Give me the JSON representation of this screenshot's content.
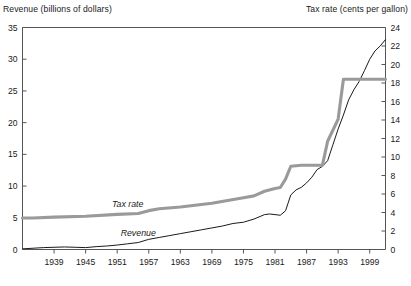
{
  "chart_data": {
    "type": "line",
    "title": "",
    "xlabel": "",
    "ylabel": "Revenue (billions of dollars)",
    "y2label": "Tax rate (cents per gallon)",
    "grid": false,
    "legend_position": "inline-annotations",
    "xlim": [
      1933,
      2002
    ],
    "ylim": [
      0,
      35
    ],
    "y2lim": [
      0,
      24
    ],
    "xticks": [
      1939,
      1945,
      1951,
      1957,
      1963,
      1969,
      1975,
      1981,
      1987,
      1993,
      1999
    ],
    "xtick_labels": [
      "1939",
      "1945",
      "1951",
      "1957",
      "1963",
      "1969",
      "1975",
      "1981",
      "1987",
      "1993",
      "1999"
    ],
    "yticks": [
      0,
      5,
      10,
      15,
      20,
      25,
      30,
      35
    ],
    "ytick_labels": [
      "0",
      "5",
      "10",
      "15",
      "20",
      "25",
      "30",
      "35"
    ],
    "y2ticks": [
      0,
      2,
      4,
      6,
      8,
      10,
      12,
      14,
      16,
      18,
      20,
      22,
      24
    ],
    "y2tick_labels": [
      "0",
      "2",
      "4",
      "6",
      "8",
      "10",
      "12",
      "14",
      "16",
      "18",
      "20",
      "22",
      "24"
    ],
    "series": [
      {
        "name": "Revenue",
        "axis": "left",
        "units": "billions of dollars",
        "color": "#1a1a1a",
        "style": "thin-black-line",
        "label_text": "Revenue",
        "x": [
          1933,
          1935,
          1937,
          1939,
          1941,
          1943,
          1945,
          1947,
          1949,
          1951,
          1953,
          1955,
          1957,
          1959,
          1961,
          1963,
          1965,
          1967,
          1969,
          1971,
          1973,
          1975,
          1977,
          1979,
          1980,
          1981,
          1982,
          1983,
          1984,
          1985,
          1986,
          1987,
          1988,
          1989,
          1990,
          1991,
          1992,
          1993,
          1994,
          1995,
          1996,
          1997,
          1998,
          1999,
          2000,
          2001,
          2002
        ],
        "values": [
          0.1,
          0.2,
          0.3,
          0.35,
          0.4,
          0.35,
          0.3,
          0.45,
          0.55,
          0.7,
          0.9,
          1.1,
          1.6,
          1.9,
          2.2,
          2.5,
          2.8,
          3.1,
          3.4,
          3.7,
          4.1,
          4.3,
          4.8,
          5.5,
          5.6,
          5.5,
          5.4,
          6.1,
          8.6,
          9.4,
          9.8,
          10.5,
          11.4,
          12.6,
          13.1,
          14.0,
          16.5,
          19.0,
          21.2,
          23.6,
          25.2,
          26.5,
          28.2,
          30.0,
          31.3,
          32.1,
          33.1
        ]
      },
      {
        "name": "Tax rate",
        "axis": "right",
        "units": "cents per gallon",
        "color": "#9a9a9a",
        "style": "thick-gray-line",
        "label_text": "Tax rate",
        "x": [
          1933,
          1935,
          1939,
          1945,
          1951,
          1955,
          1957,
          1959,
          1963,
          1969,
          1975,
          1977,
          1979,
          1981,
          1982,
          1983,
          1984,
          1986,
          1988,
          1990,
          1991,
          1993,
          1994,
          1996,
          1999,
          2002
        ],
        "values": [
          3.4,
          3.4,
          3.5,
          3.6,
          3.8,
          3.9,
          4.2,
          4.4,
          4.6,
          5.0,
          5.6,
          5.8,
          6.3,
          6.6,
          6.7,
          7.6,
          9.0,
          9.1,
          9.1,
          9.1,
          11.7,
          14.1,
          18.4,
          18.4,
          18.4,
          18.4
        ]
      }
    ],
    "annotations": [
      {
        "text": "Tax rate",
        "series": "Tax rate",
        "x": 1953,
        "italic": true
      },
      {
        "text": "Revenue",
        "series": "Revenue",
        "x": 1955,
        "italic": true
      }
    ]
  }
}
